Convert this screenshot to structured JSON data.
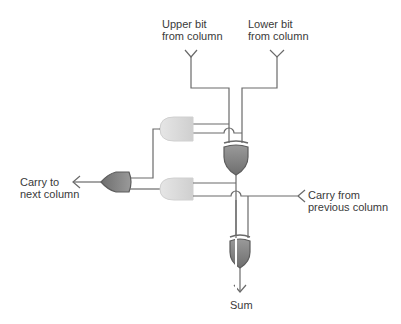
{
  "diagram": {
    "labels": {
      "upper_bit": "Upper bit\nfrom column",
      "lower_bit": "Lower bit\nfrom column",
      "carry_out": "Carry to\nnext column",
      "carry_in": "Carry from\nprevious column",
      "sum": "Sum"
    },
    "gates": [
      {
        "id": "xor-upper",
        "type": "XOR",
        "color": "#7a7a7a"
      },
      {
        "id": "and-upper",
        "type": "AND",
        "color": "#d8d8d8"
      },
      {
        "id": "or-carry",
        "type": "OR",
        "color": "#7a7a7a"
      },
      {
        "id": "and-lower",
        "type": "AND",
        "color": "#d8d8d8"
      },
      {
        "id": "xor-lower",
        "type": "XOR",
        "color": "#7a7a7a"
      }
    ],
    "colors": {
      "wire": "#6a6a6a",
      "dark_gate": "#7a7a7a",
      "light_gate": "#d8d8d8",
      "text": "#3a3a3a"
    }
  }
}
